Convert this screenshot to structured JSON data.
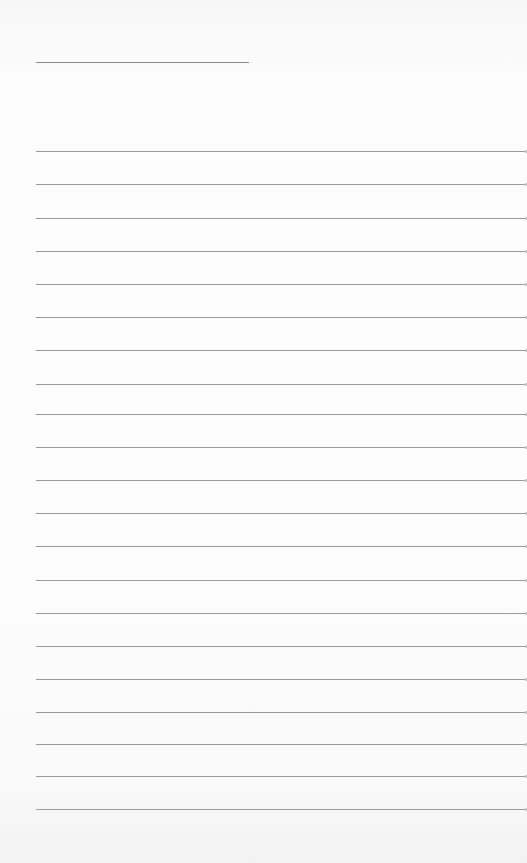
{
  "document": {
    "type": "blank lined sheet",
    "title_line": {
      "x": 36,
      "y": 62,
      "width": 213
    },
    "ruled_lines": {
      "count": 21,
      "x": 36,
      "width": 489,
      "y_positions": [
        151,
        184,
        218,
        251,
        284,
        317,
        350,
        384,
        414,
        447,
        480,
        513,
        546,
        580,
        613,
        646,
        679,
        712,
        744,
        776,
        809
      ]
    },
    "colors": {
      "paper": "#fbfbfb",
      "line": "#9a9a9a"
    }
  }
}
